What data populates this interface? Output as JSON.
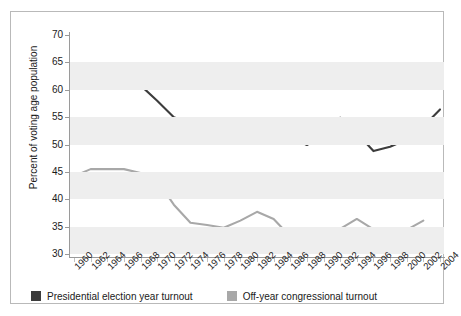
{
  "chart_data": {
    "type": "line",
    "title": "",
    "subtitle": "",
    "xlabel": "",
    "ylabel": "Percent of voting age population",
    "ylim": [
      30,
      70
    ],
    "yticks": [
      30,
      35,
      40,
      45,
      50,
      55,
      60,
      65,
      70
    ],
    "ytick_labels": [
      "30",
      "35",
      "40",
      "45",
      "50",
      "55",
      "60",
      "65",
      "70"
    ],
    "grid": "alternating-horizontal-bands",
    "legend_position": "bottom-left",
    "x": [
      1960,
      1962,
      1964,
      1966,
      1968,
      1970,
      1972,
      1974,
      1976,
      1978,
      1980,
      1982,
      1984,
      1986,
      1988,
      1990,
      1992,
      1994,
      1996,
      1998,
      2000,
      2002,
      2004
    ],
    "xtick_labels": [
      "1960",
      "1962",
      "1964",
      "1966",
      "1968",
      "1970",
      "1972",
      "1974",
      "1976",
      "1978",
      "1980",
      "1982",
      "1984",
      "1986",
      "1988",
      "1990",
      "1992",
      "1994",
      "1996",
      "1998",
      "2000",
      "2002",
      "2004"
    ],
    "series": [
      {
        "name": "Presidential election year turnout",
        "color": "#3c3c3c",
        "x": [
          1960,
          1962,
          1964,
          1966,
          1968,
          1970,
          1972,
          1974,
          1976,
          1978,
          1980,
          1982,
          1984,
          1986,
          1988,
          1990,
          1992,
          1994,
          1996,
          1998,
          2000,
          2002,
          2004
        ],
        "values": [
          62.8,
          62.1,
          61.6,
          61.2,
          60.8,
          58.0,
          55.0,
          53.9,
          53.3,
          54.3,
          52.4,
          52.6,
          53.0,
          51.5,
          49.9,
          51.9,
          54.9,
          52.1,
          48.8,
          49.6,
          50.9,
          53.3,
          56.4
        ]
      },
      {
        "name": "Off-year congressional turnout",
        "color": "#a8a8a8",
        "x": [
          1960,
          1962,
          1964,
          1966,
          1968,
          1970,
          1972,
          1974,
          1976,
          1978,
          1980,
          1982,
          1984,
          1986,
          1988,
          1990,
          1992,
          1994,
          1996,
          1998,
          2000,
          2002
        ],
        "values": [
          44.2,
          45.5,
          45.5,
          45.5,
          44.8,
          43.4,
          39.0,
          35.7,
          35.3,
          34.8,
          36.1,
          37.7,
          36.4,
          33.2,
          33.0,
          32.8,
          34.6,
          36.4,
          34.5,
          32.5,
          34.4,
          36.1
        ]
      }
    ]
  },
  "legend": {
    "items": [
      {
        "label": "Presidential election year turnout",
        "color": "#3c3c3c"
      },
      {
        "label": "Off-year congressional turnout",
        "color": "#a8a8a8"
      }
    ]
  },
  "axis": {
    "y_title": "Percent of voting age population"
  }
}
